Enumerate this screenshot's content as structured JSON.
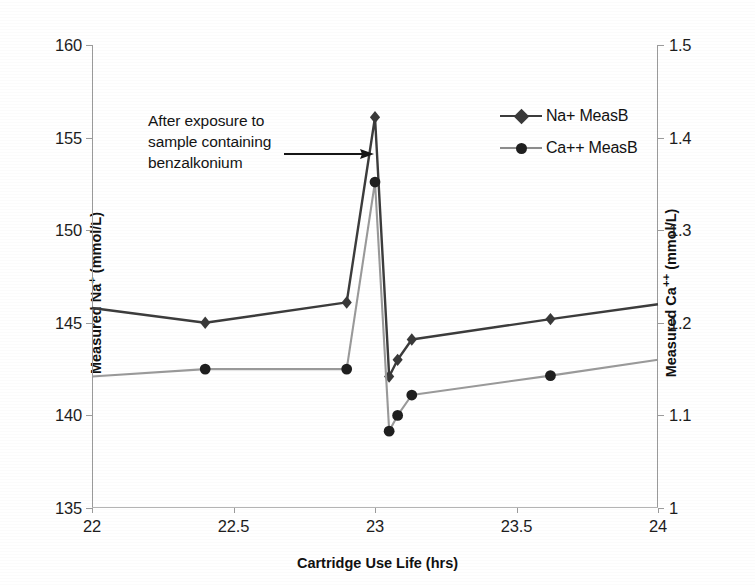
{
  "chart_data": {
    "type": "line",
    "title": "",
    "xlabel": "Cartridge Use Life (hrs)",
    "ylabel": "Measured Na+ (mmol/L)",
    "ylabel_right": "Measured Ca++ (mmol/L)",
    "xlim": [
      22,
      24
    ],
    "ylim": [
      135,
      160
    ],
    "ylim_right": [
      1,
      1.5
    ],
    "xticks": [
      "22",
      "22.5",
      "23",
      "23.5",
      "24"
    ],
    "xtick_values": [
      22,
      22.5,
      23,
      23.5,
      24
    ],
    "yticks_left": [
      "135",
      "140",
      "145",
      "150",
      "155",
      "160"
    ],
    "ytick_values_left": [
      135,
      140,
      145,
      150,
      155,
      160
    ],
    "yticks_right": [
      "1",
      "1.1",
      "1.2",
      "1.3",
      "1.4",
      "1.5"
    ],
    "ytick_values_right": [
      1,
      1.1,
      1.2,
      1.3,
      1.4,
      1.5
    ],
    "grid": false,
    "legend_position": "upper right",
    "series": [
      {
        "name": "Na+ MeasB",
        "axis": "left",
        "color": "#3c3c3c",
        "marker": "diamond",
        "x": [
          22.0,
          22.4,
          22.9,
          23.0,
          23.05,
          23.08,
          23.13,
          23.62,
          24.0
        ],
        "values": [
          145.8,
          145.0,
          146.1,
          156.1,
          142.1,
          143.0,
          144.1,
          145.2,
          146.0
        ],
        "markers_shown": [
          false,
          true,
          true,
          true,
          true,
          true,
          true,
          true,
          false
        ]
      },
      {
        "name": "Ca++ MeasB",
        "axis": "right",
        "color": "#9a9a9a",
        "marker": "circle",
        "x": [
          22.0,
          22.4,
          22.9,
          23.0,
          23.05,
          23.08,
          23.13,
          23.62,
          24.0
        ],
        "values": [
          1.142,
          1.15,
          1.15,
          1.352,
          1.083,
          1.1,
          1.122,
          1.143,
          1.16
        ],
        "markers_shown": [
          false,
          true,
          true,
          true,
          true,
          true,
          true,
          true,
          false
        ]
      }
    ],
    "annotations": [
      {
        "text": "After exposure to sample containing benzalkonium",
        "lines": [
          "After exposure to",
          "sample containing",
          "benzalkonium"
        ],
        "points_to_x": 23.0,
        "arrow": "right"
      }
    ]
  },
  "axes": {
    "x_title": "Cartridge Use Life (hrs)",
    "y_left_title_pre": "Measured Na",
    "y_left_title_sup": "+",
    "y_left_title_post": " (mmol/L)",
    "y_right_title_pre": "Measured Ca",
    "y_right_title_sup": "++",
    "y_right_title_post": " (mmol/L)"
  },
  "legend": {
    "items": [
      {
        "label": "Na+ MeasB",
        "marker": "diamond",
        "color": "#3c3c3c"
      },
      {
        "label": "Ca++ MeasB",
        "marker": "circle",
        "color": "#7f7f7f"
      }
    ]
  },
  "annotation": {
    "line1": "After exposure to",
    "line2": "sample containing",
    "line3": "benzalkonium"
  },
  "colors": {
    "na_series": "#3c3c3c",
    "ca_series": "#9a9a9a",
    "axis": "#9b9b9b",
    "text": "#1a1a1a"
  }
}
